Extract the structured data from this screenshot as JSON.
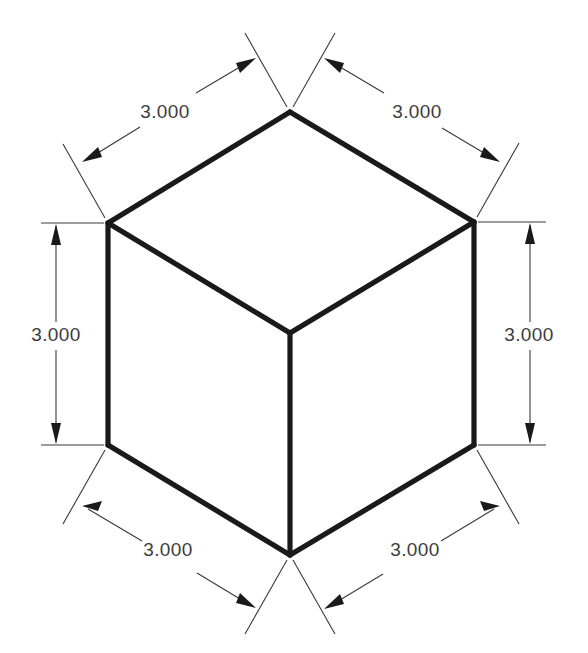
{
  "drawing": {
    "type": "isometric-cube-dimensioned",
    "background_color": "#ffffff",
    "object_line_color": "#1a1a1a",
    "dimension_line_color": "#3a3a3a",
    "text_color": "#3d3d3d",
    "unit_precision": "0.000",
    "dimensions": [
      {
        "id": "top-left-edge",
        "label": "3.000",
        "edge": "top face left-rear edge",
        "text_x": 165,
        "text_y": 113
      },
      {
        "id": "top-right-edge",
        "label": "3.000",
        "edge": "top face right-rear edge",
        "text_x": 417,
        "text_y": 113
      },
      {
        "id": "left-vertical-edge",
        "label": "3.000",
        "edge": "left face vertical edge",
        "text_x": 56,
        "text_y": 336
      },
      {
        "id": "right-vertical-edge",
        "label": "3.000",
        "edge": "right face vertical edge",
        "text_x": 529,
        "text_y": 336
      },
      {
        "id": "bottom-left-edge",
        "label": "3.000",
        "edge": "left face bottom edge",
        "text_x": 168,
        "text_y": 551
      },
      {
        "id": "bottom-right-edge",
        "label": "3.000",
        "edge": "right face bottom edge",
        "text_x": 415,
        "text_y": 551
      }
    ]
  }
}
